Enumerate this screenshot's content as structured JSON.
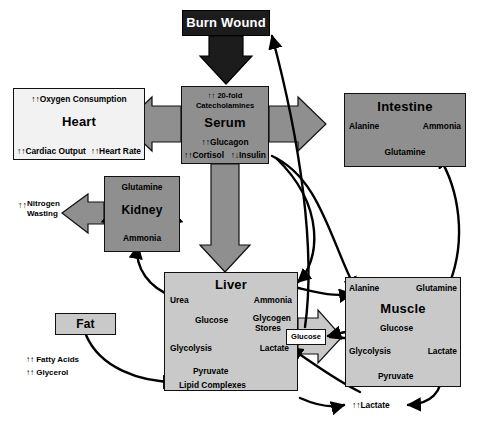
{
  "diagram": {
    "colors": {
      "burn_wound_fill": "#1c1c1c",
      "serum_fill": "#8f8f8f",
      "intestine_fill": "#8f8f8f",
      "kidney_fill": "#8f8f8f",
      "liver_fill": "#c9c9c9",
      "muscle_fill": "#c9c9c9",
      "heart_fill": "#f2f2f2",
      "fat_fill": "#c9c9c9",
      "block_arrow_fill": "#8f8f8f",
      "stroke": "#111111",
      "background": "#ffffff"
    }
  },
  "nodes": {
    "burn_wound": {
      "title": "Burn Wound"
    },
    "serum": {
      "title": "Serum",
      "top_line1": "↑↑ 20-fold",
      "top_line2": "Catecholamines",
      "glucagon": "↑↑Glucagon",
      "cortisol": "↑↑Cortisol",
      "insulin": "↑↓Insulin"
    },
    "heart": {
      "title": "Heart",
      "oxygen": "↑↑Oxygen Consumption",
      "cardiac_output": "↑↑Cardiac Output",
      "heart_rate": "↑↑Heart Rate"
    },
    "intestine": {
      "title": "Intestine",
      "alanine": "Alanine",
      "ammonia": "Ammonia",
      "glutamine": "Glutamine"
    },
    "kidney": {
      "title": "Kidney",
      "glutamine": "Glutamine",
      "ammonia": "Ammonia"
    },
    "liver": {
      "title": "Liver",
      "urea": "Urea",
      "ammonia": "Ammonia",
      "glucose": "Glucose",
      "glycogen_stores_line1": "Glycogen",
      "glycogen_stores_line2": "Stores",
      "glycolysis": "Glycolysis",
      "lactate": "Lactate",
      "pyruvate": "Pyruvate",
      "lipid_complexes": "Lipid Complexes"
    },
    "muscle": {
      "title": "Muscle",
      "alanine": "Alanine",
      "glutamine": "Glutamine",
      "glucose": "Glucose",
      "glycolysis": "Glycolysis",
      "lactate": "Lactate",
      "pyruvate": "Pyruvate"
    },
    "fat": {
      "title": "Fat"
    }
  },
  "free_labels": {
    "nitrogen_wasting_arrows": "↑↑",
    "nitrogen_wasting_line1": "Nitrogen",
    "nitrogen_wasting_line2": "Wasting",
    "fatty_acids": "↑↑ Fatty Acids",
    "glycerol": "↑↑ Glycerol",
    "lactate_increase": "↑↑Lactate",
    "glucose_bridge": "Glucose"
  }
}
